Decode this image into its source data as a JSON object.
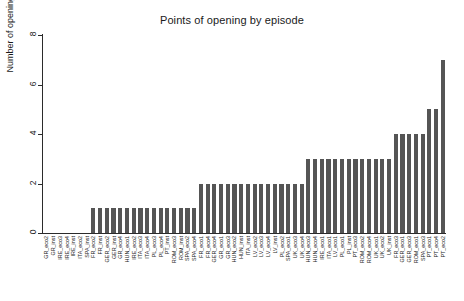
{
  "chart_data": {
    "type": "bar",
    "title": "Points of opening by episode",
    "xlabel": "",
    "ylabel": "Number of openings",
    "ylim": [
      0,
      8
    ],
    "yticks": [
      0,
      2,
      4,
      6,
      8
    ],
    "grid": false,
    "legend": null,
    "bar_color": "#555555",
    "axis_color": "#2b2b2b",
    "categories": [
      "GR_eco2",
      "GR_inst",
      "IRE_eco3",
      "IRE_eco4",
      "IRE_inst",
      "ITA_eco2",
      "SPA_inst",
      "FR_eco2",
      "FR_inst",
      "GER_eco2",
      "GER_inst",
      "GR_eco4",
      "HUN_eco1",
      "IRE_eco2",
      "ITA_eco3",
      "ITA_eco4",
      "PL_eco3",
      "PL_eco4",
      "PT_inst",
      "ROM_eco3",
      "ROM_inst",
      "SPA_eco2",
      "SPA_eco4",
      "FR_eco1",
      "FR_eco4",
      "GER_eco4",
      "GR_eco1",
      "GR_eco3",
      "HUN_eco2",
      "HUN_inst",
      "ITA_inst",
      "LV_eco2",
      "LV_eco3",
      "LV_eco4",
      "LV_inst",
      "PL_eco2",
      "SPA_eco1",
      "UK_eco3",
      "UK_eco4",
      "HUN_eco3",
      "HUN_eco4",
      "IRE_eco1",
      "ITA_eco1",
      "LV_eco1",
      "PL_eco1",
      "PL_inst",
      "PT_eco3",
      "ROM_eco2",
      "ROM_eco4",
      "UK_eco1",
      "UK_eco2",
      "UK_inst",
      "FR_eco3",
      "GER_eco1",
      "GER_eco3",
      "ROM_eco1",
      "SPA_eco3",
      "PT_eco1",
      "PT_eco4",
      "PT_eco2"
    ],
    "values": [
      0,
      0,
      0,
      0,
      0,
      0,
      0,
      1,
      1,
      1,
      1,
      1,
      1,
      1,
      1,
      1,
      1,
      1,
      1,
      1,
      1,
      1,
      1,
      2,
      2,
      2,
      2,
      2,
      2,
      2,
      2,
      2,
      2,
      2,
      2,
      2,
      2,
      2,
      2,
      3,
      3,
      3,
      3,
      3,
      3,
      3,
      3,
      3,
      3,
      3,
      3,
      3,
      4,
      4,
      4,
      4,
      4,
      5,
      5,
      7
    ]
  }
}
